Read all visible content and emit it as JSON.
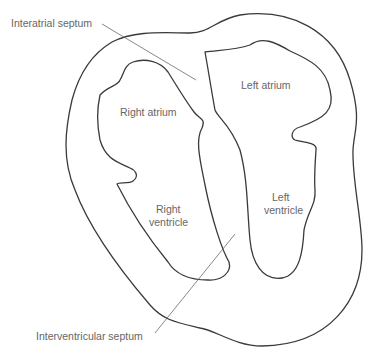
{
  "diagram": {
    "type": "heart cross-section",
    "labels": {
      "interatrial_septum": "Interatrial septum",
      "right_atrium": "Right atrium",
      "left_atrium": "Left atrium",
      "right_ventricle_line1": "Right",
      "right_ventricle_line2": "ventricle",
      "left_ventricle_line1": "Left",
      "left_ventricle_line2": "ventricle",
      "interventricular_septum": "Interventricular septum"
    },
    "colors": {
      "stroke": "#3a3a3a",
      "label": "#666666",
      "background": "#ffffff"
    }
  }
}
